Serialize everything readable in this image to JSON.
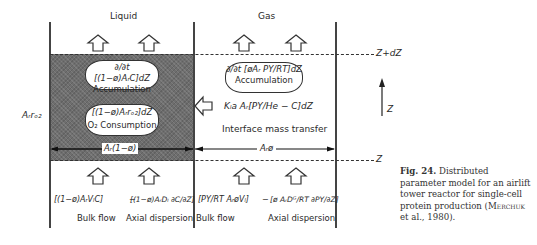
{
  "diagram": {
    "phases": {
      "liquid": "Liquid",
      "gas": "Gas"
    },
    "levels": {
      "top": "Z+dZ",
      "bottom": "Z",
      "axis": "Z"
    },
    "left_label": "Aᵣrₒ₂",
    "liquid": {
      "accumulation_expr": "∂/∂t [(1−ø)AᵣC]dZ",
      "accumulation_label": "Accumulation",
      "consumption_expr": "[(1−ø)Aᵣrₒ₂]dZ",
      "consumption_label": "O₂ Consumption",
      "area_label": "Aᵣ(1−ø)",
      "bulk_flow_expr": "[(1−ø)AᵣVₗC]",
      "minus": "−",
      "axial_dispersion_expr": "[(1−ø)AᵣDₗ ∂C/∂Z]",
      "bulk_flow_label": "Bulk flow",
      "axial_dispersion_label": "Axial dispersion"
    },
    "gas": {
      "accumulation_expr": "∂/∂t [øAᵣ PY/RT]dZ",
      "accumulation_label": "Accumulation",
      "transfer_expr": "Kₗa Aᵣ[PY/He − C]dZ",
      "transfer_label": "Interface mass transfer",
      "area_label": "Aᵣø",
      "bulk_flow_expr": "[PY/RT AᵣøVₗ]",
      "minus": "−",
      "axial_dispersion_expr": "[ø AᵣDᴳ/RT ∂PY/∂Z]",
      "bulk_flow_label": "Bulk flow",
      "axial_dispersion_label": "Axial dispersion"
    },
    "icons": [
      "up-arrow-icon",
      "left-arrow-icon",
      "double-headed-arrow-icon"
    ],
    "colors": {
      "shade": "#6e6e6e",
      "line": "#333333"
    }
  },
  "caption": {
    "fig": "Fig. 24.",
    "text": " Distributed parameter model for an airlift tower reactor for single-cell protein production (",
    "author": "Merchuk",
    "rest": " et al., 1980)."
  }
}
